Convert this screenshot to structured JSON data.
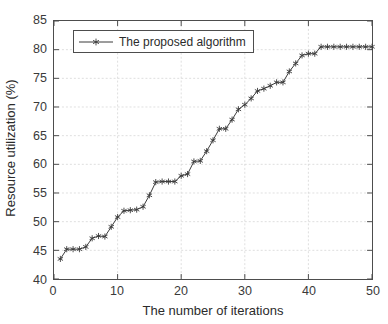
{
  "chart_data": {
    "type": "line",
    "title": "",
    "xlabel": "The number of iterations",
    "ylabel": "Resource utilization (%)",
    "xlim": [
      0,
      50
    ],
    "ylim": [
      40,
      85
    ],
    "xticks": [
      0,
      10,
      20,
      30,
      40,
      50
    ],
    "yticks": [
      40,
      45,
      50,
      55,
      60,
      65,
      70,
      75,
      80,
      85
    ],
    "grid": true,
    "legend_position": "upper left",
    "marker": "star",
    "series": [
      {
        "name": "The proposed algorithm",
        "color": "#3a3a3a",
        "x": [
          1,
          2,
          3,
          4,
          5,
          6,
          7,
          8,
          9,
          10,
          11,
          12,
          13,
          14,
          15,
          16,
          17,
          18,
          19,
          20,
          21,
          22,
          23,
          24,
          25,
          26,
          27,
          28,
          29,
          30,
          31,
          32,
          33,
          34,
          35,
          36,
          37,
          38,
          39,
          40,
          41,
          42,
          43,
          44,
          45,
          46,
          47,
          48,
          49,
          50
        ],
        "values": [
          43.5,
          45.2,
          45.2,
          45.2,
          45.6,
          47.1,
          47.5,
          47.4,
          49.1,
          50.8,
          51.9,
          52.0,
          52.1,
          52.6,
          54.6,
          56.9,
          57.0,
          57.0,
          57.0,
          58.0,
          58.3,
          60.5,
          60.6,
          62.3,
          64.2,
          66.2,
          66.2,
          67.8,
          69.6,
          70.4,
          71.5,
          72.8,
          73.2,
          73.7,
          74.3,
          74.3,
          76.2,
          77.6,
          79.0,
          79.3,
          79.3,
          80.5,
          80.5,
          80.5,
          80.5,
          80.5,
          80.5,
          80.5,
          80.5,
          80.5
        ]
      }
    ]
  },
  "legend": {
    "entries": [
      {
        "label": "The proposed algorithm"
      }
    ]
  }
}
